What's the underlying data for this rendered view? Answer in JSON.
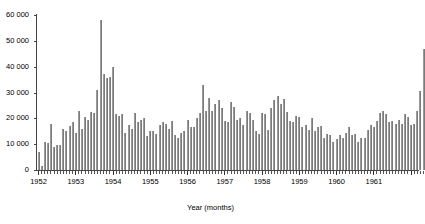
{
  "chart_data": {
    "type": "bar",
    "title": "",
    "xlabel": "Year (months)",
    "ylabel": "",
    "ylim": [
      0,
      60000
    ],
    "yticks": [
      0,
      10000,
      20000,
      30000,
      40000,
      50000,
      60000
    ],
    "ytick_labels": [
      "0",
      "10 000",
      "20 000",
      "30 000",
      "40 000",
      "50 000",
      "60 000"
    ],
    "xticks": [
      1952,
      1953,
      1954,
      1955,
      1956,
      1957,
      1958,
      1959,
      1960,
      1961
    ],
    "xtick_labels": [
      "1952",
      "1953",
      "1954",
      "1955",
      "1956",
      "1957",
      "1958",
      "1959",
      "1960",
      "1961"
    ],
    "grid": false,
    "legend": null,
    "bar_color": "#7b7b7b",
    "x_start_year": 1952,
    "x_start_month": 1,
    "categories": [
      "1952-01",
      "1952-02",
      "1952-03",
      "1952-04",
      "1952-05",
      "1952-06",
      "1952-07",
      "1952-08",
      "1952-09",
      "1952-10",
      "1952-11",
      "1952-12",
      "1953-01",
      "1953-02",
      "1953-03",
      "1953-04",
      "1953-05",
      "1953-06",
      "1953-07",
      "1953-08",
      "1953-09",
      "1953-10",
      "1953-11",
      "1953-12",
      "1954-01",
      "1954-02",
      "1954-03",
      "1954-04",
      "1954-05",
      "1954-06",
      "1954-07",
      "1954-08",
      "1954-09",
      "1954-10",
      "1954-11",
      "1954-12",
      "1955-01",
      "1955-02",
      "1955-03",
      "1955-04",
      "1955-05",
      "1955-06",
      "1955-07",
      "1955-08",
      "1955-09",
      "1955-10",
      "1955-11",
      "1955-12",
      "1956-01",
      "1956-02",
      "1956-03",
      "1956-04",
      "1956-05",
      "1956-06",
      "1956-07",
      "1956-08",
      "1956-09",
      "1956-10",
      "1956-11",
      "1956-12",
      "1957-01",
      "1957-02",
      "1957-03",
      "1957-04",
      "1957-05",
      "1957-06",
      "1957-07",
      "1957-08",
      "1957-09",
      "1957-10",
      "1957-11",
      "1957-12",
      "1958-01",
      "1958-02",
      "1958-03",
      "1958-04",
      "1958-05",
      "1958-06",
      "1958-07",
      "1958-08",
      "1958-09",
      "1958-10",
      "1958-11",
      "1958-12",
      "1959-01",
      "1959-02",
      "1959-03",
      "1959-04",
      "1959-05",
      "1959-06",
      "1959-07",
      "1959-08",
      "1959-09",
      "1959-10",
      "1959-11",
      "1959-12",
      "1960-01",
      "1960-02",
      "1960-03",
      "1960-04",
      "1960-05",
      "1960-06",
      "1960-07",
      "1960-08",
      "1960-09",
      "1960-10",
      "1960-11",
      "1960-12",
      "1961-01",
      "1961-02",
      "1961-03",
      "1961-04",
      "1961-05",
      "1961-06",
      "1961-07",
      "1961-08",
      "1961-09",
      "1961-10",
      "1961-11",
      "1961-12",
      "1962-01",
      "1962-02",
      "1962-03",
      "1962-04",
      "1962-05"
    ],
    "values": [
      7000,
      1500,
      11000,
      10500,
      18000,
      9000,
      9500,
      9500,
      16000,
      15000,
      17000,
      18500,
      14500,
      23000,
      16000,
      20500,
      19500,
      22500,
      22000,
      31000,
      58000,
      37000,
      35500,
      36000,
      40000,
      21500,
      21000,
      21500,
      14500,
      17500,
      16000,
      22000,
      18500,
      19500,
      20000,
      13000,
      15000,
      15000,
      14000,
      17500,
      18500,
      18000,
      16000,
      19000,
      13500,
      12500,
      14500,
      15000,
      19500,
      16500,
      16500,
      20000,
      22000,
      33000,
      23000,
      28000,
      23000,
      25500,
      27000,
      24000,
      19000,
      18500,
      26500,
      24500,
      19500,
      20000,
      17500,
      23000,
      22000,
      19500,
      15000,
      14000,
      22000,
      21500,
      15500,
      24000,
      27000,
      28500,
      25500,
      27500,
      22500,
      19000,
      18500,
      21000,
      20500,
      16500,
      17500,
      15500,
      20000,
      15000,
      16500,
      17000,
      12500,
      14000,
      13500,
      11000,
      12000,
      13500,
      12500,
      14500,
      16500,
      13500,
      14000,
      11000,
      12500,
      12500,
      15500,
      17500,
      16500,
      19000,
      22000,
      23000,
      21500,
      18500,
      19000,
      18000,
      19500,
      18000,
      21500,
      20500,
      17500,
      18000,
      23000,
      30500,
      47000
    ]
  },
  "caption": {
    "text": ""
  }
}
